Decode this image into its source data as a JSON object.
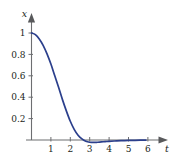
{
  "chart_data": {
    "type": "line",
    "title": "",
    "subtitle": "",
    "xlabel": "t",
    "ylabel": "x",
    "xlim": [
      -0.15,
      6.6
    ],
    "ylim": [
      -0.09,
      1.12
    ],
    "grid": false,
    "legend": null,
    "x_ticks": [
      1,
      2,
      3,
      4,
      5,
      6
    ],
    "x_tick_labels": [
      "1",
      "2",
      "3",
      "4",
      "5",
      "6"
    ],
    "y_ticks": [
      0.2,
      0.4,
      0.6,
      0.8,
      1
    ],
    "y_tick_labels": [
      "0.2",
      "0.4",
      "0.6",
      "0.8",
      "1"
    ],
    "series": [
      {
        "name": "x(t)",
        "color": "#2b3f8c",
        "x": [
          0,
          0.2,
          0.4,
          0.6,
          0.8,
          1.0,
          1.2,
          1.4,
          1.6,
          1.8,
          2.0,
          2.2,
          2.4,
          2.6,
          2.8,
          3.0,
          3.2,
          3.4,
          3.6,
          3.8,
          4.0,
          4.4,
          4.8,
          5.2,
          5.6,
          5.9
        ],
        "values": [
          1.0,
          0.985,
          0.945,
          0.885,
          0.805,
          0.71,
          0.6,
          0.49,
          0.375,
          0.27,
          0.175,
          0.1,
          0.045,
          0.01,
          -0.012,
          -0.021,
          -0.023,
          -0.021,
          -0.018,
          -0.015,
          -0.012,
          -0.008,
          -0.005,
          -0.003,
          -0.002,
          -0.001
        ]
      }
    ]
  },
  "axes": {
    "y_axis_name": "x",
    "x_axis_name": "t"
  }
}
